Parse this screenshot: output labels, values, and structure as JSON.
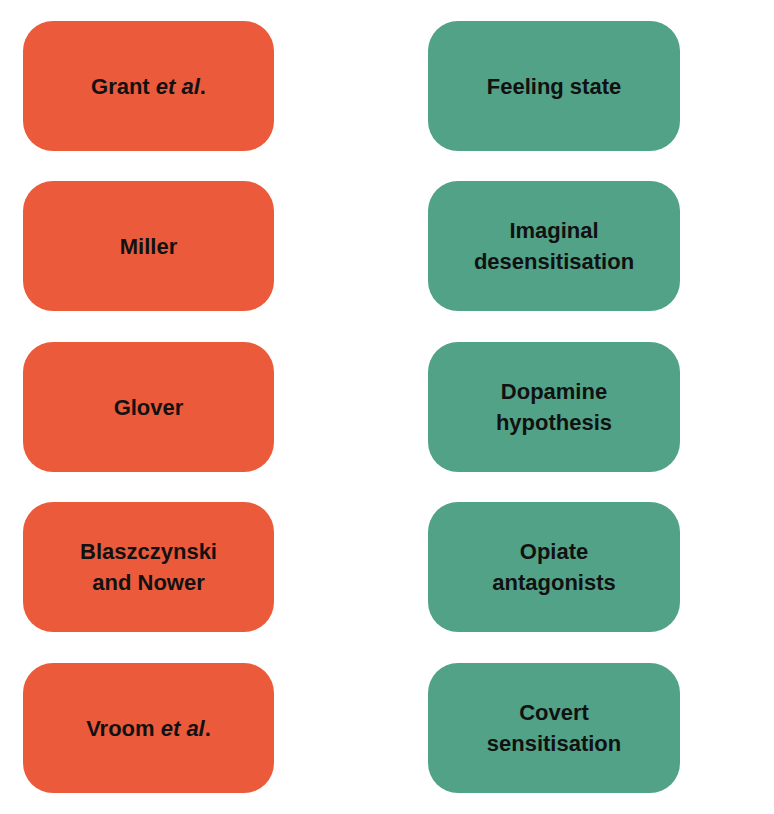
{
  "colors": {
    "author_box": "#ec5a3c",
    "concept_box": "#52a287",
    "text": "#111111"
  },
  "authors": [
    {
      "main": "Grant ",
      "italic": "et al",
      "suffix": "."
    },
    {
      "main": "Miller",
      "italic": "",
      "suffix": ""
    },
    {
      "main": "Glover",
      "italic": "",
      "suffix": ""
    },
    {
      "main": "Blaszczynski and Nower",
      "italic": "",
      "suffix": ""
    },
    {
      "main": "Vroom ",
      "italic": "et al",
      "suffix": "."
    }
  ],
  "concepts": [
    "Feeling state",
    "Imaginal desensitisation",
    "Dopamine hypothesis",
    "Opiate antagonists",
    "Covert sensitisation"
  ]
}
